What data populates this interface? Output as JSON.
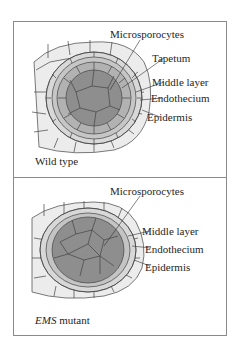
{
  "figure": {
    "panels": [
      {
        "id": "wild-type",
        "caption": "Wild type",
        "labels": {
          "microsporocytes": "Microsporocytes",
          "tapetum": "Tapetum",
          "middle_layer": "Middle layer",
          "endothecium": "Endothecium",
          "epidermis": "Epidermis"
        }
      },
      {
        "id": "ems-mutant",
        "caption_italic": "EMS",
        "caption_rest": " mutant",
        "labels": {
          "microsporocytes": "Microsporocytes",
          "middle_layer": "Middle layer",
          "endothecium": "Endothecium",
          "epidermis": "Epidermis"
        }
      }
    ],
    "colors": {
      "border": "#8a8a8a",
      "epidermis_fill": "#ededed",
      "endothecium_fill": "#d9d9d9",
      "middle_fill": "#c4c4c4",
      "tapetum_fill": "#b0b0b0",
      "microsporocyte_fill": "#8f8f8f",
      "cell_line": "#444444"
    }
  }
}
